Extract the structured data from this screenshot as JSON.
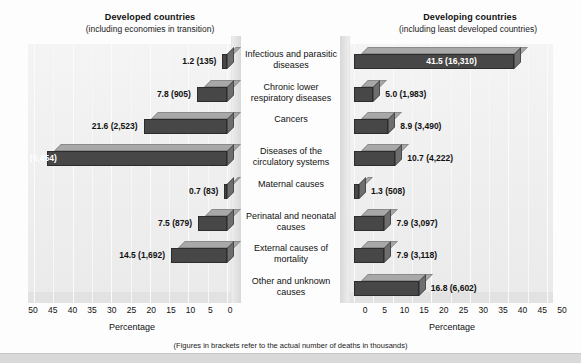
{
  "chart_data": {
    "type": "bar",
    "orientation": "horizontal",
    "grid": true,
    "legend_position": "none",
    "xlabel": "Percentage",
    "ylabel": "",
    "footnote": "(Figures in brackets refer to the actual number of deaths in thousands)",
    "categories": [
      "Infectious and parasitic diseases",
      "Chronic lower respiratory diseases",
      "Cancers",
      "Diseases of the circulatory systems",
      "Maternal causes",
      "Perinatal and neonatal causes",
      "External causes of mortality",
      "Other and unknown causes"
    ],
    "xlim": [
      0,
      50
    ],
    "xticks": [
      0,
      5,
      10,
      15,
      20,
      25,
      30,
      35,
      40,
      45,
      50
    ],
    "series": [
      {
        "name": "Developed countries (including economies in transition)",
        "direction": "left",
        "values": [
          1.2,
          7.8,
          21.6,
          46.7,
          0.7,
          7.5,
          14.5,
          0.0
        ],
        "counts": [
          135,
          905,
          2523,
          5454,
          83,
          879,
          1692,
          null
        ],
        "labels": [
          "1.2 (135)",
          "7.8 (905)",
          "21.6 (2,523)",
          "46.7 (5,454)",
          "0.7 (83)",
          "7.5 (879)",
          "14.5 (1,692)",
          ""
        ]
      },
      {
        "name": "Developing countries (including least developed countries)",
        "direction": "right",
        "values": [
          41.5,
          5.0,
          8.9,
          10.7,
          1.3,
          7.9,
          7.9,
          16.8
        ],
        "counts": [
          16310,
          1983,
          3490,
          4222,
          508,
          3097,
          3118,
          6602
        ],
        "labels": [
          "41.5 (16,310)",
          "5.0 (1,983)",
          "8.9 (3,490)",
          "10.7 (4,222)",
          "1.3 (508)",
          "7.9 (3,097)",
          "7.9 (3,118)",
          "16.8 (6,602)"
        ]
      }
    ]
  },
  "panels": {
    "left": {
      "title": "Developed countries",
      "subtitle": "(including economies in transition)",
      "axis_title": "Percentage",
      "ticks": [
        "50",
        "45",
        "40",
        "35",
        "30",
        "25",
        "20",
        "15",
        "10",
        "5",
        "0"
      ]
    },
    "right": {
      "title": "Developing countries",
      "subtitle": "(including least developed countries)",
      "axis_title": "Percentage",
      "ticks": [
        "0",
        "5",
        "10",
        "15",
        "20",
        "25",
        "30",
        "35",
        "40",
        "45",
        "50"
      ]
    }
  },
  "colors": {
    "bar_front": "#474747",
    "bar_top": "#a8a8a8",
    "bar_side": "#6e6e6e",
    "plot_background": "#eeeeee",
    "page_background": "#fdfdfd"
  }
}
